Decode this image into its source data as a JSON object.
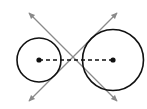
{
  "diagram": {
    "colors": {
      "background": "#ffffff",
      "circle_stroke": "#111111",
      "tangent_stroke": "#8a8a8a",
      "center_dot": "#111111",
      "center_line": "#111111"
    },
    "circles": [
      {
        "name": "left-circle",
        "cx": 39,
        "cy": 60,
        "r": 22
      },
      {
        "name": "right-circle",
        "cx": 113,
        "cy": 60,
        "r": 30.5
      }
    ],
    "center_segment": {
      "x1": 39,
      "y1": 60,
      "x2": 113,
      "y2": 60,
      "style": "dashed"
    },
    "tangent_lines": [
      {
        "name": "tangent-line-descending",
        "x1": 29,
        "y1": 13,
        "x2": 117,
        "y2": 101,
        "arrows": "both"
      },
      {
        "name": "tangent-line-ascending",
        "x1": 29,
        "y1": 101,
        "x2": 117,
        "y2": 13,
        "arrows": "both"
      }
    ],
    "intersection_point": {
      "x": 72,
      "y": 60
    }
  }
}
